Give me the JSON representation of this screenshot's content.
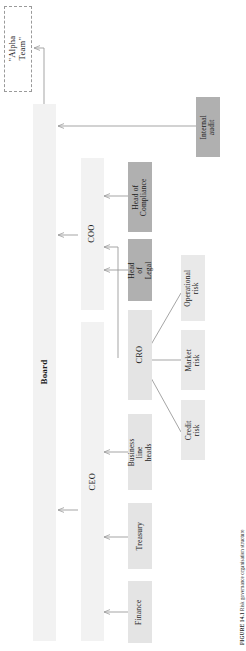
{
  "figure": {
    "caption_label": "FIGURE 14.1",
    "caption_text": "Risk governance organisation structure"
  },
  "diagram": {
    "type": "organisation-chart",
    "orientation": "rotated-90-ccw",
    "title": "Risk governance organisation structure",
    "nodes": {
      "alpha_team": {
        "label": "\"Alpha Team\"",
        "style": "dashed-outline"
      },
      "board": {
        "label": "Board",
        "style": "pale-bar",
        "bold": true
      },
      "ceo": {
        "label": "CEO",
        "style": "pale-bar"
      },
      "coo": {
        "label": "COO",
        "style": "pale-bar"
      },
      "cro": {
        "label": "CRO",
        "style": "light-bar"
      },
      "internal_audit": {
        "label": "Internal\naudit",
        "style": "dark-box"
      },
      "head_of_compliance": {
        "label": "Head of\nCompliance",
        "style": "dark-box"
      },
      "head_of_legal": {
        "label": "Head of\nLegal",
        "style": "dark-box"
      },
      "business_line_heads": {
        "label": "Business line\nheads",
        "style": "light-box"
      },
      "treasury": {
        "label": "Treasury",
        "style": "light-box"
      },
      "finance": {
        "label": "Finance",
        "style": "light-box"
      },
      "operational_risk": {
        "label": "Operational\nrisk",
        "style": "pale-box"
      },
      "market_risk": {
        "label": "Market\nrisk",
        "style": "pale-box"
      },
      "credit_risk": {
        "label": "Credit\nrisk",
        "style": "pale-box"
      }
    },
    "edges": [
      {
        "from": "board",
        "to": "alpha_team"
      },
      {
        "from": "internal_audit",
        "to": "board"
      },
      {
        "from": "coo",
        "to": "board"
      },
      {
        "from": "ceo",
        "to": "board"
      },
      {
        "from": "head_of_compliance",
        "to": "coo"
      },
      {
        "from": "head_of_legal",
        "to": "coo"
      },
      {
        "from": "cro",
        "to": "coo"
      },
      {
        "from": "business_line_heads",
        "to": "ceo"
      },
      {
        "from": "treasury",
        "to": "ceo"
      },
      {
        "from": "finance",
        "to": "ceo"
      },
      {
        "from": "operational_risk",
        "to": "cro"
      },
      {
        "from": "market_risk",
        "to": "cro"
      },
      {
        "from": "credit_risk",
        "to": "cro"
      }
    ]
  },
  "colors": {
    "pale": "#f2f2f2",
    "light": "#e4e4e4",
    "dark": "#b0b0b0",
    "line": "#9b9b9b",
    "dash": "#9a9a9a",
    "text": "#1a1a1a"
  }
}
